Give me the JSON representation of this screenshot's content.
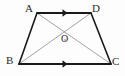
{
  "figure": {
    "type": "geometry-diagram",
    "shape": "trapezoid",
    "background_color": "#fdfdfd",
    "outline_color": "#1a1a1a",
    "diagonal_color": "#8a8a8a",
    "label_color": "#2b2b2b",
    "vertices": [
      {
        "id": "A",
        "label": "A",
        "x": 37,
        "y": 13
      },
      {
        "id": "D",
        "label": "D",
        "x": 91,
        "y": 13
      },
      {
        "id": "B",
        "label": "B",
        "x": 19,
        "y": 64
      },
      {
        "id": "C",
        "label": "C",
        "x": 111,
        "y": 64
      }
    ],
    "intersection": {
      "id": "O",
      "label": "O",
      "x": 65,
      "y": 40
    },
    "sides": [
      {
        "id": "AD",
        "from": "A",
        "to": "D",
        "style": "thick",
        "marker": "single-arrow"
      },
      {
        "id": "BC",
        "from": "B",
        "to": "C",
        "style": "thick",
        "marker": "single-arrow"
      },
      {
        "id": "AB",
        "from": "A",
        "to": "B",
        "style": "thick",
        "marker": "none"
      },
      {
        "id": "DC",
        "from": "D",
        "to": "C",
        "style": "thick",
        "marker": "none"
      }
    ],
    "diagonals": [
      {
        "id": "AC",
        "from": "A",
        "to": "C",
        "style": "thin"
      },
      {
        "id": "BD",
        "from": "B",
        "to": "D",
        "style": "thin"
      }
    ]
  }
}
